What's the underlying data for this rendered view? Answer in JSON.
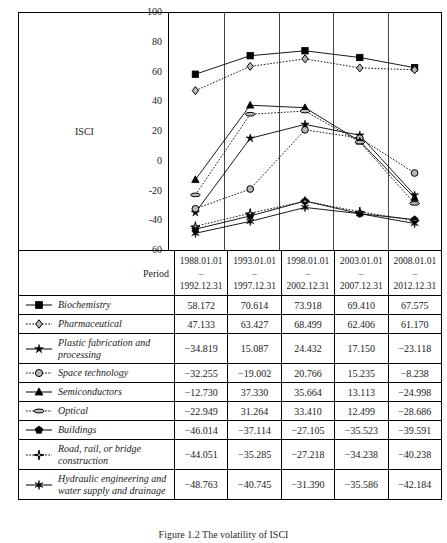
{
  "figure": {
    "caption": "Figure 1.2 The volatility of ISCI"
  },
  "chart_data": {
    "type": "line",
    "title": "",
    "xlabel": "Period",
    "ylabel": "ISCI",
    "ylim": [
      -60,
      100
    ],
    "yticks": [
      100,
      80,
      60,
      40,
      20,
      0,
      -20,
      -40,
      -60
    ],
    "grid": "vertical-column-dividers",
    "legend_position": "table-below",
    "categories": [
      "1988.01.01 – 1992.12.31",
      "1993.01.01 – 1997.12.31",
      "1998.01.01 – 2002.12.31",
      "2003.01.01 – 2007.12.31",
      "2008.01.01 – 2012.12.31"
    ],
    "series": [
      {
        "name": "Biochemistry",
        "marker": "filled-square",
        "line": "solid",
        "values": [
          58.172,
          70.614,
          73.918,
          69.41,
          62.575
        ]
      },
      {
        "name": "Pharmaceutical",
        "marker": "open-diamond",
        "line": "dotted",
        "values": [
          47.133,
          63.427,
          68.499,
          62.406,
          61.17
        ]
      },
      {
        "name": "Plastic fabrication and processing",
        "marker": "filled-star",
        "line": "solid",
        "values": [
          -34.819,
          15.087,
          24.432,
          17.15,
          -23.118
        ]
      },
      {
        "name": "Space technology",
        "marker": "open-circle",
        "line": "dotted",
        "values": [
          -32.255,
          -19.002,
          20.766,
          15.235,
          -8.238
        ]
      },
      {
        "name": "Semiconductors",
        "marker": "filled-triangle",
        "line": "solid",
        "values": [
          -12.73,
          37.33,
          35.664,
          13.113,
          -24.998
        ]
      },
      {
        "name": "Optical",
        "marker": "open-ellipse",
        "line": "dotted",
        "values": [
          -22.949,
          31.264,
          33.41,
          12.499,
          -28.686
        ]
      },
      {
        "name": "Buildings",
        "marker": "filled-pentagon",
        "line": "solid",
        "values": [
          -46.014,
          -37.114,
          -27.105,
          -35.523,
          -39.591
        ]
      },
      {
        "name": "Road, rail, or bridge construction",
        "marker": "open-four-star",
        "line": "dotted",
        "values": [
          -44.051,
          -35.285,
          -27.218,
          -34.238,
          -40.238
        ]
      },
      {
        "name": "Hydraulic engineering and water supply and drainage",
        "marker": "filled-six-star",
        "line": "solid",
        "values": [
          -48.763,
          -40.745,
          -31.39,
          -35.586,
          -42.184
        ]
      }
    ]
  },
  "table": {
    "row_header_label": "Period",
    "columns": [
      {
        "start": "1988.01.01",
        "dash": "–",
        "end": "1992.12.31"
      },
      {
        "start": "1993.01.01",
        "dash": "–",
        "end": "1997.12.31"
      },
      {
        "start": "1998.01.01",
        "dash": "–",
        "end": "2002.12.31"
      },
      {
        "start": "2003.01.01",
        "dash": "–",
        "end": "2007.12.31"
      },
      {
        "start": "2008.01.01",
        "dash": "–",
        "end": "2012.12.31"
      }
    ],
    "rows": [
      {
        "label": "Biochemistry",
        "marker": "filled-square",
        "line": "solid",
        "tall": false,
        "values": [
          "58.172",
          "70.614",
          "73.918",
          "69.410",
          "67.575"
        ]
      },
      {
        "label": "Pharmaceutical",
        "marker": "open-diamond",
        "line": "dotted",
        "tall": false,
        "values": [
          "47.133",
          "63.427",
          "68.499",
          "62.406",
          "61.170"
        ]
      },
      {
        "label": "Plastic fabrication and processing",
        "marker": "filled-star",
        "line": "solid",
        "tall": true,
        "values": [
          "−34.819",
          "15.087",
          "24.432",
          "17.150",
          "−23.118"
        ]
      },
      {
        "label": "Space technology",
        "marker": "open-circle",
        "line": "dotted",
        "tall": false,
        "values": [
          "−32.255",
          "−19.002",
          "20.766",
          "15.235",
          "−8.238"
        ]
      },
      {
        "label": "Semiconductors",
        "marker": "filled-triangle",
        "line": "solid",
        "tall": false,
        "values": [
          "−12.730",
          "37.330",
          "35.664",
          "13.113",
          "−24.998"
        ]
      },
      {
        "label": "Optical",
        "marker": "open-ellipse",
        "line": "dotted",
        "tall": false,
        "values": [
          "−22.949",
          "31.264",
          "33.410",
          "12.499",
          "−28.686"
        ]
      },
      {
        "label": "Buildings",
        "marker": "filled-pentagon",
        "line": "solid",
        "tall": false,
        "values": [
          "−46.014",
          "−37.114",
          "−27.105",
          "−35.523",
          "−39.591"
        ]
      },
      {
        "label": "Road, rail, or bridge construction",
        "marker": "open-four-star",
        "line": "dotted",
        "tall": true,
        "values": [
          "−44.051",
          "−35.285",
          "−27.218",
          "−34.238",
          "−40.238"
        ]
      },
      {
        "label": "Hydraulic engineering and water supply and drainage",
        "marker": "filled-six-star",
        "line": "solid",
        "tall": true,
        "values": [
          "−48.763",
          "−40.745",
          "−31.390",
          "−35.586",
          "−42.184"
        ]
      }
    ]
  },
  "colors": {
    "ink": "#000000",
    "marker_fill_light": "#b8b8b8",
    "paper": "#ffffff"
  }
}
